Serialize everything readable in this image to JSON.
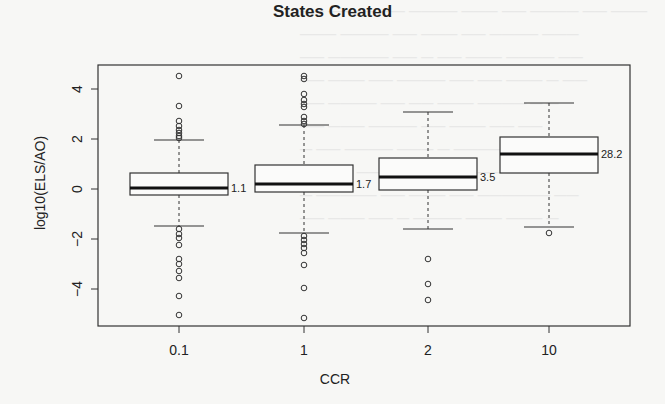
{
  "chart_data": {
    "type": "box",
    "title": "States Created",
    "xlabel": "CCR",
    "ylabel": "log10(ELS/AO)",
    "ylim": [
      -5.4,
      5
    ],
    "yticks": [
      -4,
      -2,
      0,
      2,
      4
    ],
    "categories": [
      "0.1",
      "1",
      "2",
      "10"
    ],
    "boxes": [
      {
        "label": "0.1",
        "q1": -0.24,
        "median": 0.04,
        "q3": 0.64,
        "whisker_low": -1.48,
        "whisker_high": 1.96,
        "annotation": "1.1",
        "outliers": [
          4.52,
          3.32,
          2.72,
          2.52,
          2.36,
          2.24,
          2.12,
          2.04,
          -1.6,
          -1.8,
          -1.96,
          -2.24,
          -2.8,
          -3.0,
          -3.28,
          -3.56,
          -4.28,
          -5.04
        ]
      },
      {
        "label": "1",
        "q1": -0.12,
        "median": 0.2,
        "q3": 0.96,
        "whisker_low": -1.76,
        "whisker_high": 2.56,
        "annotation": "1.7",
        "outliers": [
          4.52,
          4.4,
          3.8,
          3.56,
          3.4,
          3.28,
          2.88,
          2.72,
          2.6,
          -1.88,
          -2.04,
          -2.2,
          -2.36,
          -2.56,
          -3.04,
          -3.96,
          -5.16
        ]
      },
      {
        "label": "2",
        "q1": -0.04,
        "median": 0.48,
        "q3": 1.24,
        "whisker_low": -1.6,
        "whisker_high": 3.08,
        "annotation": "3.5",
        "outliers": [
          -2.8,
          -3.8,
          -4.44
        ]
      },
      {
        "label": "10",
        "q1": 0.64,
        "median": 1.4,
        "q3": 2.08,
        "whisker_low": -1.52,
        "whisker_high": 3.44,
        "annotation": "28.2",
        "outliers": [
          -1.76
        ]
      }
    ]
  }
}
